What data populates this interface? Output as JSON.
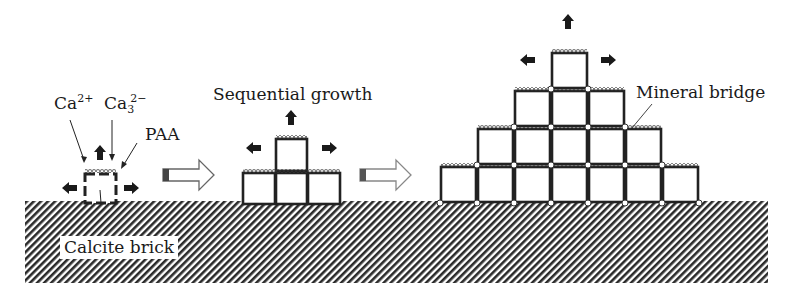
{
  "labels": {
    "ca_ion": {
      "base": "Ca",
      "sup": "2+"
    },
    "carbonate_ion": {
      "base": "Ca",
      "sub": "3",
      "sup": "2−"
    },
    "paa": "PAA",
    "sequential_growth": "Sequential growth",
    "mineral_bridge": "Mineral bridge",
    "calcite_brick": "Calcite brick"
  },
  "stages": [
    {
      "name": "nucleation",
      "boxes": [
        [
          83,
          172
        ]
      ]
    },
    {
      "name": "sequential-growth",
      "boxes": [
        [
          242,
          172
        ],
        [
          275,
          172
        ],
        [
          307,
          172
        ],
        [
          275,
          138
        ]
      ]
    },
    {
      "name": "mineral-bridge-pyramid",
      "rows": 4,
      "bottom_row_count": 7
    }
  ],
  "colors": {
    "ink": "#1a1a1a",
    "substrate_fill": "#555555",
    "background": "#ffffff"
  }
}
